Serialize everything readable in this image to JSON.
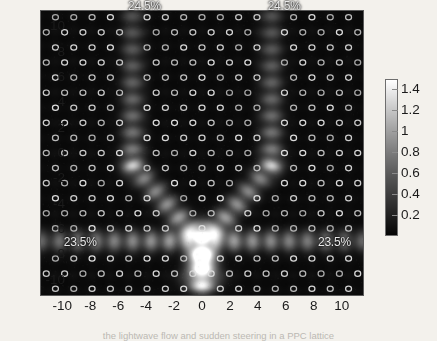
{
  "figure": {
    "type": "photonic-crystal-field-intensity-map",
    "background_color": "#f3f1ec",
    "plot_background_color": "#070707"
  },
  "caption": {
    "text": "the lightwave flow and sudden steering in a PPC lattice"
  },
  "annotations": [
    {
      "name": "port-top-left",
      "label": "24.5%",
      "x": -5.3,
      "y": 11.6
    },
    {
      "name": "port-top-right",
      "label": "24.5%",
      "x": 4.7,
      "y": 11.6
    },
    {
      "name": "port-bottom-left",
      "label": "23.5%",
      "x": -9.9,
      "y": -7.0
    },
    {
      "name": "port-bottom-right",
      "label": "23.5%",
      "x": 8.3,
      "y": -7.0
    }
  ],
  "axes": {
    "x": {
      "label": "",
      "min": -11.6,
      "max": 11.6,
      "ticks": [
        -10,
        -8,
        -6,
        -4,
        -2,
        0,
        2,
        4,
        6,
        8,
        10
      ],
      "tick_labels": [
        "-10",
        "-8",
        "-6",
        "-4",
        "-2",
        "0",
        "2",
        "4",
        "6",
        "8",
        "10"
      ]
    },
    "y": {
      "label": "",
      "min": -11.3,
      "max": 11.3,
      "ticks": [
        10,
        8,
        6,
        4,
        2,
        0,
        -2,
        -4,
        -6,
        -8,
        -10
      ],
      "tick_labels": [
        "10",
        "8",
        "6",
        "4",
        "2",
        "0",
        "-2",
        "-4",
        "-6",
        "-8",
        "-10"
      ]
    }
  },
  "colorbar": {
    "name": "intensity-colorbar",
    "colormap": "gray",
    "orientation": "vertical",
    "min": 0.0,
    "max": 1.5,
    "ticks": [
      1.4,
      1.2,
      1,
      0.8,
      0.6,
      0.4,
      0.2
    ],
    "tick_labels": [
      "1.4",
      "1.2",
      "1",
      "0.8",
      "0.6",
      "0.4",
      "0.2"
    ]
  },
  "chart_data": {
    "type": "heatmap",
    "title": "",
    "xlabel": "",
    "ylabel": "",
    "xlim": [
      -11.6,
      11.6
    ],
    "ylim": [
      -11.3,
      11.3
    ],
    "zlim": [
      0,
      1.5
    ],
    "colormap": "gray",
    "grid": false,
    "legend_position": "right-colorbar",
    "lattice": {
      "kind": "triangular-air-hole-array",
      "marker": "ring",
      "rows_y": [
        10.8,
        9.6,
        8.4,
        7.2,
        6.0,
        4.8,
        3.6,
        2.4,
        1.2,
        0.0,
        -1.2,
        -2.4,
        -3.6,
        -4.8,
        -6.0,
        -7.2,
        -8.4,
        -9.6,
        -10.8
      ],
      "column_pitch": 1.32,
      "row_offset_alternating": 0.66
    },
    "source": {
      "name": "input-source",
      "x": 0.0,
      "y": -8.4,
      "intensity": 1.5
    },
    "waveguide_branches": [
      {
        "name": "branch-up-left",
        "type": "vertical",
        "x": -5.0,
        "y_from": -1.0,
        "y_to": 11.3,
        "peak_intensity": 1.0
      },
      {
        "name": "branch-up-right",
        "type": "vertical",
        "x": 5.0,
        "y_from": -1.0,
        "y_to": 11.3,
        "peak_intensity": 1.0
      },
      {
        "name": "branch-diag-left",
        "type": "diagonal",
        "x_from": -5.0,
        "y_from": -1.0,
        "x_to": -0.6,
        "y_to": -6.5,
        "peak_intensity": 0.95
      },
      {
        "name": "branch-diag-right",
        "type": "diagonal",
        "x_from": 5.0,
        "y_from": -1.0,
        "x_to": 0.6,
        "y_to": -6.5,
        "peak_intensity": 0.95
      },
      {
        "name": "branch-horiz-left",
        "type": "horizontal",
        "y": -7.0,
        "x_from": -11.6,
        "x_to": -1.0,
        "peak_intensity": 0.9
      },
      {
        "name": "branch-horiz-right",
        "type": "horizontal",
        "y": -7.0,
        "x_from": 1.0,
        "x_to": 11.6,
        "peak_intensity": 0.9
      },
      {
        "name": "feed-stem",
        "type": "vertical",
        "x": 0.0,
        "y_from": -10.6,
        "y_to": -6.6,
        "peak_intensity": 1.4
      }
    ],
    "output_power_split": [
      {
        "port": "top-left",
        "value": 24.5,
        "unit": "%"
      },
      {
        "port": "top-right",
        "value": 24.5,
        "unit": "%"
      },
      {
        "port": "bottom-left",
        "value": 23.5,
        "unit": "%"
      },
      {
        "port": "bottom-right",
        "value": 23.5,
        "unit": "%"
      }
    ]
  }
}
